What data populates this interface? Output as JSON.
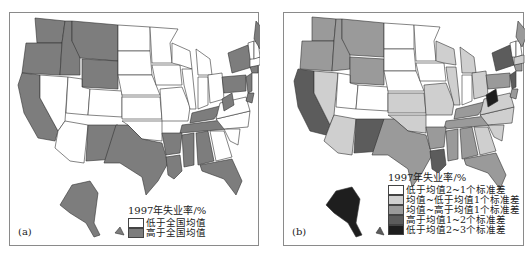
{
  "panels": [
    {
      "label": "(a)",
      "legend": {
        "title": "1997年失业率/%",
        "items": [
          {
            "label": "低于全国均值",
            "color": "#ffffff"
          },
          {
            "label": "高于全国均值",
            "color": "#7d7d7d"
          }
        ]
      }
    },
    {
      "label": "(b)",
      "legend": {
        "title": "1997年失业率/%",
        "items": [
          {
            "label": "低于均值2~1个标准差",
            "color": "#ffffff"
          },
          {
            "label": "均值~低于均值1个标准差",
            "color": "#cfcfcf"
          },
          {
            "label": "均值~高于均值1个标准差",
            "color": "#9a9a9a"
          },
          {
            "label": "高于均值1~2个标准差",
            "color": "#5c5c5c"
          },
          {
            "label": "低于均值2~3个标准差",
            "color": "#1e1e1e"
          }
        ]
      }
    }
  ],
  "colors": {
    "a_below": "#ffffff",
    "a_above": "#7d7d7d",
    "b_c1": "#ffffff",
    "b_c2": "#cfcfcf",
    "b_c3": "#9a9a9a",
    "b_c4": "#5c5c5c",
    "b_c5": "#1e1e1e"
  }
}
